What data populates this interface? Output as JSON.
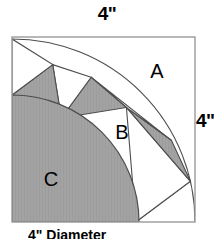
{
  "figure": {
    "dimensions": {
      "top_label": "4\"",
      "right_label": "4\""
    },
    "caption": "4\" Diameter",
    "region_labels": {
      "a": "A",
      "b": "B",
      "c": "C"
    },
    "colors": {
      "shaded_fill": "#a3a3a3",
      "background": "#ffffff",
      "stroke": "#4d4d4d",
      "square_stroke": "#9a9a9a",
      "text": "#000000"
    },
    "geometry": {
      "square": {
        "x": 12,
        "y": 37,
        "width": 183,
        "height": 185
      },
      "arc_center": {
        "x": 12,
        "y": 222
      },
      "inner_radius": 127,
      "outer_radius": 183,
      "spoke_count": 7,
      "spoke_angles_deg": [
        0,
        12.857,
        25.714,
        38.571,
        51.429,
        64.286,
        77.143,
        90
      ],
      "shaded_spoke_indices": [
        0,
        2,
        4,
        6
      ],
      "white_spoke_indices": [
        1,
        3,
        5
      ]
    },
    "label_positions": {
      "a": {
        "x": 157,
        "y": 78
      },
      "b": {
        "x": 122,
        "y": 139
      },
      "c": {
        "x": 51,
        "y": 186
      }
    }
  }
}
